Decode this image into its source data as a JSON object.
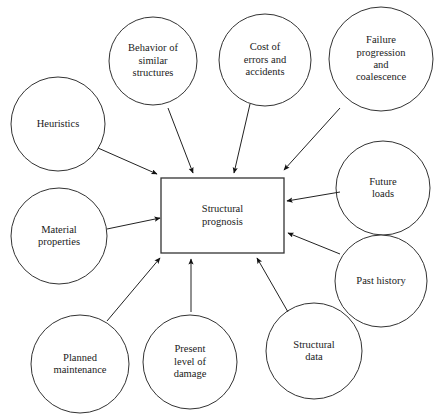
{
  "diagram": {
    "center": {
      "label": "Structural\nprognosis",
      "shape": "rectangle",
      "x": 161,
      "y": 178,
      "width": 123,
      "height": 75
    },
    "stroke_color": "#333333",
    "fill_color": "#ffffff",
    "text_color": "#1a1a1a",
    "nodes": [
      {
        "id": "behavior-of-similar-structures",
        "label": "Behavior of\nsimilar\nstructures",
        "shape": "circle",
        "cx": 153,
        "cy": 61,
        "r": 44
      },
      {
        "id": "cost-of-errors-and-accidents",
        "label": "Cost of\nerrors and\naccidents",
        "shape": "circle",
        "cx": 265,
        "cy": 60,
        "r": 46
      },
      {
        "id": "failure-progression-and-coalescence",
        "label": "Failure\nprogression\nand\ncoalescence",
        "shape": "circle",
        "cx": 381,
        "cy": 59,
        "r": 52
      },
      {
        "id": "heuristics",
        "label": "Heuristics",
        "shape": "circle",
        "cx": 58,
        "cy": 124,
        "r": 47
      },
      {
        "id": "material-properties",
        "label": "Material\nproperties",
        "shape": "circle",
        "cx": 59,
        "cy": 236,
        "r": 48
      },
      {
        "id": "future-loads",
        "label": "Future\nloads",
        "shape": "circle",
        "cx": 383,
        "cy": 188,
        "r": 47
      },
      {
        "id": "past-history",
        "label": "Past history",
        "shape": "circle",
        "cx": 381,
        "cy": 281,
        "r": 46
      },
      {
        "id": "planned-maintenance",
        "label": "Planned\nmaintenance",
        "shape": "circle",
        "cx": 80,
        "cy": 364,
        "r": 49
      },
      {
        "id": "present-level-of-damage",
        "label": "Present\nlevel of\ndamage",
        "shape": "circle",
        "cx": 190,
        "cy": 362,
        "r": 47
      },
      {
        "id": "structural-data",
        "label": "Structural\ndata",
        "shape": "circle",
        "cx": 314,
        "cy": 351,
        "r": 48
      }
    ],
    "arrows": [
      {
        "id": "arrow-heuristics-to-center",
        "from": "heuristics",
        "to": "center",
        "x1": 98,
        "y1": 148,
        "x2": 157,
        "y2": 174
      },
      {
        "id": "arrow-behavior-to-center",
        "from": "behavior-of-similar-structures",
        "to": "center",
        "x1": 168,
        "y1": 108,
        "x2": 193,
        "y2": 173
      },
      {
        "id": "arrow-cost-to-center",
        "from": "cost-of-errors-and-accidents",
        "to": "center",
        "x1": 250,
        "y1": 104,
        "x2": 234,
        "y2": 173
      },
      {
        "id": "arrow-failure-to-center",
        "from": "failure-progression-and-coalescence",
        "to": "center",
        "x1": 340,
        "y1": 108,
        "x2": 284,
        "y2": 170
      },
      {
        "id": "arrow-future-loads-to-center",
        "from": "future-loads",
        "to": "center",
        "x1": 340,
        "y1": 192,
        "x2": 287,
        "y2": 201
      },
      {
        "id": "arrow-past-history-to-center",
        "from": "past-history",
        "to": "center",
        "x1": 340,
        "y1": 254,
        "x2": 288,
        "y2": 233
      },
      {
        "id": "arrow-material-properties-to-center",
        "from": "material-properties",
        "to": "center",
        "x1": 107,
        "y1": 229,
        "x2": 160,
        "y2": 218
      },
      {
        "id": "arrow-planned-maintenance-to-center",
        "from": "planned-maintenance",
        "to": "center",
        "x1": 107,
        "y1": 321,
        "x2": 160,
        "y2": 258
      },
      {
        "id": "arrow-present-level-to-center",
        "from": "present-level-of-damage",
        "to": "center",
        "x1": 191,
        "y1": 312,
        "x2": 191,
        "y2": 259
      },
      {
        "id": "arrow-structural-data-to-center",
        "from": "structural-data",
        "to": "center",
        "x1": 288,
        "y1": 312,
        "x2": 257,
        "y2": 258
      }
    ]
  }
}
